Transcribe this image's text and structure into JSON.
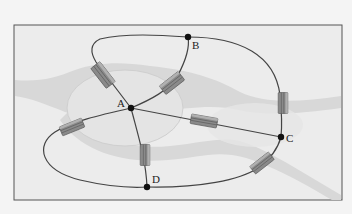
{
  "diagram": {
    "colors": {
      "background": "#f4f4f4",
      "frame_bg": "#ececec",
      "frame_border": "#555555",
      "land": "#e9e9e9",
      "river": "#d6d6d6",
      "river_edge": "#c8c8c8",
      "island": "#e4e4e4",
      "edge": "#444444",
      "node": "#111111",
      "bridge_fill": "#8a8a8a",
      "bridge_dark": "#5e5e5e"
    },
    "nodes": [
      {
        "id": "A",
        "label": "A",
        "x": 131,
        "y": 108
      },
      {
        "id": "B",
        "label": "B",
        "x": 188,
        "y": 37
      },
      {
        "id": "C",
        "label": "C",
        "x": 281,
        "y": 137
      },
      {
        "id": "D",
        "label": "D",
        "x": 147,
        "y": 187
      }
    ],
    "edges": [
      {
        "from": "A",
        "to": "B",
        "via": "upper-left loop"
      },
      {
        "from": "A",
        "to": "B",
        "via": "direct curve"
      },
      {
        "from": "A",
        "to": "C",
        "via": "straight"
      },
      {
        "from": "A",
        "to": "D",
        "via": "straight"
      },
      {
        "from": "A",
        "to": "D",
        "via": "left loop"
      },
      {
        "from": "B",
        "to": "C",
        "via": "right arc"
      },
      {
        "from": "C",
        "to": "D",
        "via": "bottom arc"
      }
    ],
    "bridge_count": 7
  }
}
